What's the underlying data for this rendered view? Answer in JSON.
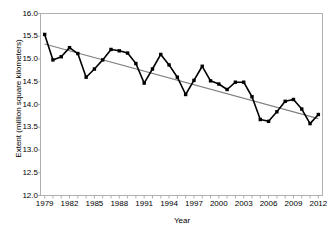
{
  "chart_data": {
    "type": "line",
    "title": "",
    "xlabel": "Year",
    "ylabel": "Extent (million square kilometers)",
    "xlim": [
      1978.5,
      2012.5
    ],
    "ylim": [
      12.0,
      16.0
    ],
    "grid": false,
    "legend": "none",
    "ytick_labels": [
      "16.0",
      "15.5",
      "15.0",
      "14.5",
      "14.0",
      "13.5",
      "13.0",
      "12.5",
      "12.0"
    ],
    "ytick_values": [
      16.0,
      15.5,
      15.0,
      14.5,
      14.0,
      13.5,
      13.0,
      12.5,
      12.0
    ],
    "xtick_labels": [
      "1979",
      "1982",
      "1985",
      "1988",
      "1991",
      "1994",
      "1997",
      "2000",
      "2003",
      "2006",
      "2009",
      "2012"
    ],
    "xtick_values": [
      1979,
      1982,
      1985,
      1988,
      1991,
      1994,
      1997,
      2000,
      2003,
      2006,
      2009,
      2012
    ],
    "x": [
      1979,
      1980,
      1981,
      1982,
      1983,
      1984,
      1985,
      1986,
      1987,
      1988,
      1989,
      1990,
      1991,
      1992,
      1993,
      1994,
      1995,
      1996,
      1997,
      1998,
      1999,
      2000,
      2001,
      2002,
      2003,
      2004,
      2005,
      2006,
      2007,
      2008,
      2009,
      2010,
      2011,
      2012
    ],
    "series": [
      {
        "name": "Extent",
        "color": "#000000",
        "marker": "square",
        "values": [
          15.54,
          14.98,
          15.05,
          15.25,
          15.12,
          14.6,
          14.78,
          14.98,
          15.21,
          15.18,
          15.13,
          14.9,
          14.47,
          14.78,
          15.1,
          14.87,
          14.6,
          14.22,
          14.53,
          14.84,
          14.52,
          14.45,
          14.33,
          14.49,
          14.49,
          14.17,
          13.67,
          13.63,
          13.84,
          14.07,
          14.11,
          13.9,
          13.58,
          13.78
        ]
      }
    ],
    "trendline": {
      "name": "Linear trend",
      "color": "#808080",
      "start": {
        "x": 1979,
        "y": 15.33
      },
      "end": {
        "x": 2012,
        "y": 13.69
      }
    }
  }
}
